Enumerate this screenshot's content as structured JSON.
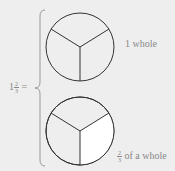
{
  "equation": {
    "whole": "1",
    "numerator": "2",
    "denominator": "3",
    "equals": "="
  },
  "top_circle": {
    "label": "1 whole",
    "sectors": 3,
    "shaded_sectors": 0
  },
  "bottom_circle": {
    "label_numerator": "2",
    "label_denominator": "3",
    "label_text": "of a whole",
    "sectors": 3,
    "white_sectors": 1
  },
  "colors": {
    "background": "#eeeeee",
    "stroke": "#333333",
    "highlight": "#ffffff",
    "text": "#888888"
  }
}
